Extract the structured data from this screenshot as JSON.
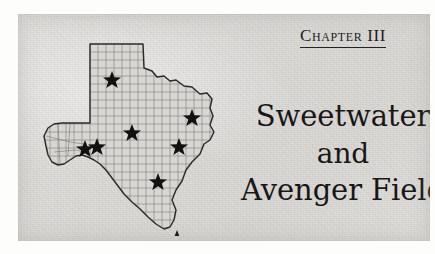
{
  "page": {
    "background_color": "#ffffff",
    "panel_color": "#dedcda",
    "ink_color": "#181716"
  },
  "chapter": {
    "label": "Chapter III"
  },
  "title": {
    "lines": [
      {
        "text": "Sweetwater"
      },
      {
        "text": "and"
      },
      {
        "text": "Avenger Field"
      }
    ]
  },
  "map": {
    "name": "texas-state-map",
    "outline_color": "#2b2a27",
    "county_line_color": "#6f6d69",
    "fill_color": "#d6d4d0",
    "star_color": "#121110",
    "stars": [
      {
        "id": "star-panhandle",
        "x": 88,
        "y": 54
      },
      {
        "id": "star-north",
        "x": 168,
        "y": 92
      },
      {
        "id": "star-central",
        "x": 108,
        "y": 107
      },
      {
        "id": "star-east",
        "x": 155,
        "y": 121
      },
      {
        "id": "star-west-a",
        "x": 61,
        "y": 123
      },
      {
        "id": "star-west-b",
        "x": 72,
        "y": 121
      },
      {
        "id": "star-south",
        "x": 134,
        "y": 156
      },
      {
        "id": "star-southtip",
        "x": 153,
        "y": 213
      }
    ],
    "star_count": 8
  }
}
